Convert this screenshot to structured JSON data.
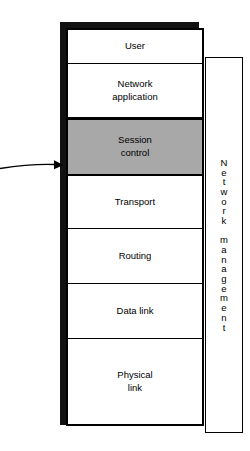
{
  "diagram": {
    "colors": {
      "stroke": "#000000",
      "fill": "#ffffff",
      "highlight_fill": "#a8a8a8",
      "shadow": "#111111"
    },
    "stack": {
      "name": "protocol-stack",
      "layers": [
        {
          "id": "user",
          "label": "User",
          "highlighted": false
        },
        {
          "id": "network-application",
          "label": "Network\napplication",
          "highlighted": false
        },
        {
          "id": "session-control",
          "label": "Session\ncontrol",
          "highlighted": true
        },
        {
          "id": "transport",
          "label": "Transport",
          "highlighted": false
        },
        {
          "id": "routing",
          "label": "Routing",
          "highlighted": false
        },
        {
          "id": "data-link",
          "label": "Data link",
          "highlighted": false
        },
        {
          "id": "physical-link",
          "label": "Physical\nlink",
          "highlighted": false
        }
      ]
    },
    "side_panel": {
      "id": "network-management",
      "label": "Network management",
      "vertical_label": "N\ne\nt\nw\no\nr\nk\n \nm\na\nn\na\ng\ne\nm\ne\nn\nt",
      "orientation": "vertical"
    },
    "annotation": {
      "id": "session-control-pointer",
      "kind": "arrow",
      "points_to": "Session control",
      "label": ""
    }
  }
}
